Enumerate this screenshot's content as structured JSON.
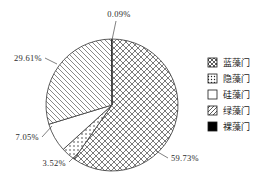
{
  "chart_data": {
    "type": "pie",
    "title": "",
    "categories": [
      "蓝藻门",
      "隐藻门",
      "硅藻门",
      "绿藻门",
      "裸藻门"
    ],
    "values": [
      59.73,
      3.52,
      7.05,
      29.61,
      0.09
    ],
    "value_labels": [
      "59.73%",
      "3.52%",
      "7.05%",
      "29.61%",
      "0.09%"
    ],
    "units": "%",
    "legend_position": "right",
    "grid": false,
    "start_angle_deg": 0,
    "direction": "clockwise",
    "patterns": [
      "cross-hatch",
      "dotted",
      "blank",
      "diagonal-hatch",
      "solid-black"
    ],
    "slices": [
      {
        "label": "蓝藻门",
        "value": 59.73,
        "value_label": "59.73%",
        "pattern": "cross-hatch"
      },
      {
        "label": "隐藻门",
        "value": 3.52,
        "value_label": "3.52%",
        "pattern": "dotted"
      },
      {
        "label": "硅藻门",
        "value": 7.05,
        "value_label": "7.05%",
        "pattern": "blank"
      },
      {
        "label": "绿藻门",
        "value": 29.61,
        "value_label": "29.61%",
        "pattern": "diagonal-hatch"
      },
      {
        "label": "裸藻门",
        "value": 0.09,
        "value_label": "0.09%",
        "pattern": "solid-black"
      }
    ]
  },
  "labels": {
    "top": "0.09%",
    "left_upper": "29.61%",
    "left_lower": "7.05%",
    "bottom_left": "3.52%",
    "bottom_right": "59.73%"
  },
  "legend": {
    "items": [
      {
        "label": "蓝藻门",
        "pattern": "cross-hatch"
      },
      {
        "label": "隐藻门",
        "pattern": "dotted"
      },
      {
        "label": "硅藻门",
        "pattern": "blank"
      },
      {
        "label": "绿藻门",
        "pattern": "diagonal-hatch"
      },
      {
        "label": "裸藻门",
        "pattern": "solid-black"
      }
    ]
  },
  "colors": {
    "outline": "#333333",
    "fill": "#ffffff",
    "black": "#000000",
    "text": "#1a1a1a"
  }
}
